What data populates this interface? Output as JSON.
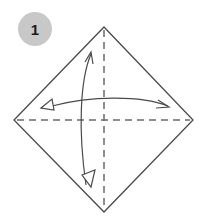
{
  "step": {
    "number": "1",
    "badge_color": "#c8c8c8",
    "text_color": "#1a1a1a"
  },
  "diagram": {
    "line_color": "#4a4a4a",
    "dash_color": "#6a6a6a",
    "folds": [
      {
        "type": "valley-fold-and-unfold",
        "axis": "vertical",
        "icon": "double-arrow-vertical-icon"
      },
      {
        "type": "valley-fold-and-unfold",
        "axis": "horizontal",
        "icon": "double-arrow-horizontal-icon"
      }
    ]
  }
}
